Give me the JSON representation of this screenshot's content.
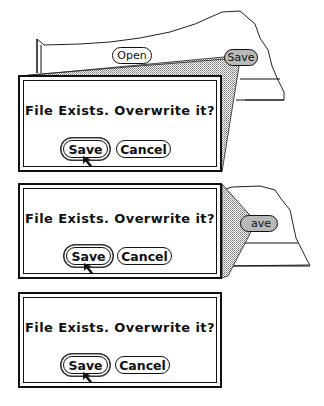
{
  "background_window": {
    "open_button": "Open",
    "save_button": "Save",
    "save_button_partial": "ave"
  },
  "frames": [
    {
      "stage": "zooming-out",
      "dialog": {
        "message": "File Exists. Overwrite it?",
        "save_button": "Save",
        "cancel_button": "Cancel",
        "default_button": "Save"
      }
    },
    {
      "stage": "emerging",
      "dialog": {
        "message": "File Exists. Overwrite it?",
        "save_button": "Save",
        "cancel_button": "Cancel",
        "default_button": "Save"
      }
    },
    {
      "stage": "final",
      "dialog": {
        "message": "File Exists. Overwrite it?",
        "save_button": "Save",
        "cancel_button": "Cancel",
        "default_button": "Save"
      }
    }
  ],
  "colors": {
    "ink": "#111111",
    "stipple": "#bdbdbd",
    "button_pressed": "#b8b8b8"
  }
}
